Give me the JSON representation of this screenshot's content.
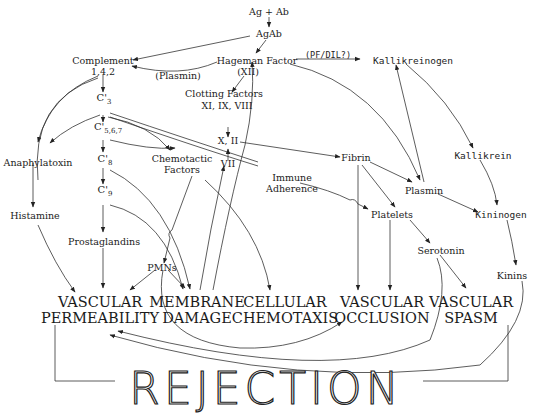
{
  "diagram": {
    "nodes": {
      "ag_ab": "Ag + Ab",
      "agab": "AgAb",
      "complement": "Complement",
      "complement_sub": "1,4,2",
      "hageman": "Hageman Factor",
      "hageman_sub": "(XII)",
      "pf_dil": "(PF/DIL?)",
      "kallikreinogen": "Kallikreinogen",
      "plasmin_label": "(Plasmin)",
      "clotting": "Clotting  Factors",
      "clotting_sub": "XI, IX, VIII",
      "c3": "C'",
      "c3_sub": "3",
      "c567": "C'",
      "c567_sub": "5,6,7",
      "x_ii": "X, II",
      "vii": "VII",
      "anaphylatoxin": "Anaphylatoxin",
      "c8": "C'",
      "c8_sub": "8",
      "chemotactic": "Chemotactic",
      "chemotactic_2": "Factors",
      "immune": "Immune",
      "immune_2": "Adherence",
      "fibrin": "Fibrin",
      "kallikrein": "Kallikrein",
      "plasmin": "Plasmin",
      "c9": "C'",
      "c9_sub": "9",
      "histamine": "Histamine",
      "platelets": "Platelets",
      "kininogen": "Kininogen",
      "prostaglandins": "Prostaglandins",
      "serotonin": "Serotonin",
      "pmns": "PMNs",
      "kinins": "Kinins"
    },
    "outcomes": [
      {
        "line1": "VASCULAR",
        "line2": "PERMEABILITY"
      },
      {
        "line1": "MEMBRANE",
        "line2": "DAMAGE"
      },
      {
        "line1": "CELLULAR",
        "line2": "CHEMOTAXIS"
      },
      {
        "line1": "VASCULAR",
        "line2": "OCCLUSION"
      },
      {
        "line1": "VASCULAR",
        "line2": "SPASM"
      }
    ],
    "result": "REJECTION"
  }
}
